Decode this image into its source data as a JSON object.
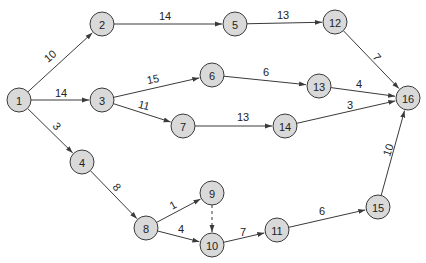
{
  "diagram": {
    "type": "network",
    "nodes": [
      {
        "id": "1",
        "x": 19,
        "y": 100
      },
      {
        "id": "2",
        "x": 102,
        "y": 24
      },
      {
        "id": "3",
        "x": 102,
        "y": 100
      },
      {
        "id": "4",
        "x": 82,
        "y": 162
      },
      {
        "id": "5",
        "x": 235,
        "y": 24
      },
      {
        "id": "6",
        "x": 212,
        "y": 75
      },
      {
        "id": "7",
        "x": 183,
        "y": 126
      },
      {
        "id": "8",
        "x": 146,
        "y": 228
      },
      {
        "id": "9",
        "x": 212,
        "y": 193
      },
      {
        "id": "10",
        "x": 212,
        "y": 245
      },
      {
        "id": "11",
        "x": 277,
        "y": 230
      },
      {
        "id": "12",
        "x": 335,
        "y": 22
      },
      {
        "id": "13",
        "x": 319,
        "y": 86
      },
      {
        "id": "14",
        "x": 285,
        "y": 126
      },
      {
        "id": "15",
        "x": 378,
        "y": 207
      },
      {
        "id": "16",
        "x": 408,
        "y": 98
      }
    ],
    "edges": [
      {
        "from": "1",
        "to": "2",
        "weight": "10",
        "lx": 50,
        "ly": 56,
        "rot": -40
      },
      {
        "from": "1",
        "to": "3",
        "weight": "14",
        "lx": 61,
        "ly": 93,
        "rot": 0
      },
      {
        "from": "1",
        "to": "4",
        "weight": "3",
        "lx": 57,
        "ly": 126,
        "rot": 50
      },
      {
        "from": "2",
        "to": "5",
        "weight": "14",
        "lx": 165,
        "ly": 16,
        "rot": 0
      },
      {
        "from": "3",
        "to": "6",
        "weight": "15",
        "lx": 153,
        "ly": 79,
        "rot": -12
      },
      {
        "from": "3",
        "to": "7",
        "weight": "11",
        "lx": 144,
        "ly": 105,
        "rot": 15
      },
      {
        "from": "4",
        "to": "8",
        "weight": "8",
        "lx": 117,
        "ly": 187,
        "rot": 50
      },
      {
        "from": "5",
        "to": "12",
        "weight": "13",
        "lx": 283,
        "ly": 15,
        "rot": 0
      },
      {
        "from": "6",
        "to": "13",
        "weight": "6",
        "lx": 266,
        "ly": 72,
        "rot": 0
      },
      {
        "from": "7",
        "to": "14",
        "weight": "13",
        "lx": 243,
        "ly": 117,
        "rot": 0
      },
      {
        "from": "8",
        "to": "9",
        "weight": "1",
        "lx": 173,
        "ly": 205,
        "rot": -30
      },
      {
        "from": "8",
        "to": "10",
        "weight": "4",
        "lx": 181,
        "ly": 229,
        "rot": 0
      },
      {
        "from": "9",
        "to": "10",
        "weight": "",
        "dashed": true
      },
      {
        "from": "10",
        "to": "11",
        "weight": "7",
        "lx": 243,
        "ly": 232,
        "rot": 0
      },
      {
        "from": "11",
        "to": "15",
        "weight": "6",
        "lx": 322,
        "ly": 211,
        "rot": 0
      },
      {
        "from": "12",
        "to": "16",
        "weight": "7",
        "lx": 377,
        "ly": 57,
        "rot": 50
      },
      {
        "from": "13",
        "to": "16",
        "weight": "4",
        "lx": 359,
        "ly": 84,
        "rot": 0
      },
      {
        "from": "14",
        "to": "16",
        "weight": "3",
        "lx": 350,
        "ly": 105,
        "rot": 0
      },
      {
        "from": "15",
        "to": "16",
        "weight": "10",
        "lx": 388,
        "ly": 150,
        "rot": -70
      }
    ],
    "colors": {
      "node_fill": "#d9d9d9",
      "stroke": "#3a3a3a"
    }
  }
}
